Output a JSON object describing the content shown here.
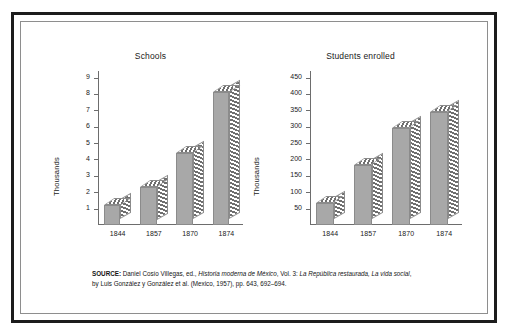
{
  "figure": {
    "source_label": "SOURCE:",
    "source_line1_a": " Daniel Cosío Villegas, ed., ",
    "source_line1_italic": "Historia moderna de México",
    "source_line1_b": ", Vol. 3: ",
    "source_line1_italic2": "La República restaurada, La vida social",
    "source_line1_c": ",",
    "source_line2_a": "by Luis González y González et al. (Mexico, 1957), pp. 643, 692–694."
  },
  "chart_data": [
    {
      "type": "bar",
      "title": "Schools",
      "xlabel": "",
      "ylabel": "Thousands",
      "categories": [
        "1844",
        "1857",
        "1870",
        "1874"
      ],
      "values": [
        1.25,
        2.35,
        4.4,
        8.1
      ],
      "yticks": [
        1,
        2,
        3,
        4,
        5,
        6,
        7,
        8,
        9
      ],
      "ytick_labels": [
        "1",
        "2",
        "3",
        "4",
        "5",
        "6",
        "7",
        "8",
        "9"
      ],
      "ylim": [
        0,
        9.4
      ],
      "grid": false,
      "legend": "none",
      "bar_face_color": "#a8a8a8",
      "bar_hatch_color": "#6f6f6f"
    },
    {
      "type": "bar",
      "title": "Students enrolled",
      "xlabel": "",
      "ylabel": "Thousands",
      "categories": [
        "1844",
        "1857",
        "1870",
        "1874"
      ],
      "values": [
        67,
        182,
        295,
        345
      ],
      "yticks": [
        50,
        100,
        150,
        200,
        250,
        300,
        350,
        400,
        450
      ],
      "ytick_labels": [
        "50",
        "100",
        "150",
        "200",
        "250",
        "300",
        "350",
        "400",
        "450"
      ],
      "ylim": [
        0,
        470
      ],
      "grid": false,
      "legend": "none",
      "bar_face_color": "#a8a8a8",
      "bar_hatch_color": "#6f6f6f"
    }
  ]
}
